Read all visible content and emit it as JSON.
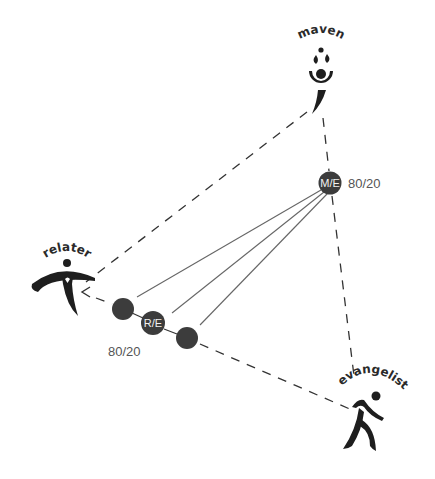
{
  "roles": {
    "maven": {
      "label": "maven",
      "icon": "maven-figure-icon"
    },
    "relater": {
      "label": "relater",
      "icon": "relater-figure-icon"
    },
    "evangelist": {
      "label": "evangelist",
      "icon": "evangelist-runner-icon"
    }
  },
  "nodes": {
    "me": {
      "label": "M/E",
      "ratio": "80/20"
    },
    "re": {
      "label": "R/E",
      "ratio": "80/20"
    },
    "re_left": {
      "label": ""
    },
    "re_right": {
      "label": ""
    }
  },
  "colors": {
    "background": "#ffffff",
    "node_fill": "#3c3c3c",
    "figure_fill": "#1e1e1e",
    "dashed_line": "#333333",
    "solid_line": "#666666",
    "ratio_text": "#555555"
  }
}
